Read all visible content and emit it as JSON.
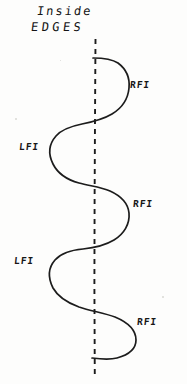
{
  "canvas": {
    "width": 187,
    "height": 384,
    "background_color": "#fdfdfc",
    "ink_color": "#1c1c1c",
    "media": "hand-drawn-pencil-sketch"
  },
  "title": {
    "line1": "Inside",
    "line2": "EDGES"
  },
  "centerline": {
    "style": "dashed",
    "orientation": "vertical",
    "x": 95,
    "y_start": 38,
    "y_end": 380,
    "color": "#1c1c1c"
  },
  "labels": [
    {
      "id": "rfi-1",
      "text": "RFI",
      "side": "right",
      "x": 130,
      "y": 80
    },
    {
      "id": "lfi-1",
      "text": "LFI",
      "side": "left",
      "x": 19,
      "y": 142
    },
    {
      "id": "rfi-2",
      "text": "RFI",
      "side": "right",
      "x": 133,
      "y": 199
    },
    {
      "id": "lfi-2",
      "text": "LFI",
      "side": "left",
      "x": 14,
      "y": 256
    },
    {
      "id": "rfi-3",
      "text": "RFI",
      "side": "right",
      "x": 137,
      "y": 317
    }
  ],
  "curve": {
    "description": "serpentine wave oscillating across the vertical dashed centerline",
    "lobes": [
      {
        "index": 1,
        "side": "right",
        "label": "RFI",
        "apex_x": 128,
        "apex_y": 88
      },
      {
        "index": 2,
        "side": "left",
        "label": "LFI",
        "apex_x": 51,
        "apex_y": 150
      },
      {
        "index": 3,
        "side": "right",
        "label": "RFI",
        "apex_x": 128,
        "apex_y": 210
      },
      {
        "index": 4,
        "side": "left",
        "label": "LFI",
        "apex_x": 50,
        "apex_y": 266
      },
      {
        "index": 5,
        "side": "right",
        "label": "RFI",
        "apex_x": 138,
        "apex_y": 325
      }
    ],
    "start_point": {
      "x": 93,
      "y": 58
    },
    "end_point": {
      "x": 92,
      "y": 358
    }
  }
}
